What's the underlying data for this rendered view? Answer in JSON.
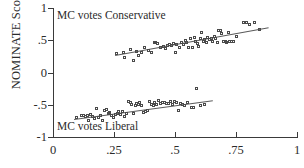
{
  "chart_data": {
    "type": "scatter",
    "title": "",
    "xlabel": "",
    "ylabel": "NOMINATE Score",
    "xlim": [
      0,
      1
    ],
    "ylim": [
      -1,
      1
    ],
    "grid": false,
    "legend": null,
    "xticks": [
      "0",
      ".25",
      ".5",
      ".75",
      "1"
    ],
    "xtick_values": [
      0,
      0.25,
      0.5,
      0.75,
      1
    ],
    "yticks": [
      "1",
      ".5",
      "0",
      "-.5",
      "-1"
    ],
    "ytick_values": [
      1,
      0.5,
      0,
      -0.5,
      -1
    ],
    "annotations": [
      {
        "text": "MC votes Conservative",
        "x": 0.02,
        "y": 0.93
      },
      {
        "text": "MC votes Liberal",
        "x": 0.02,
        "y": -0.8
      }
    ],
    "series": [
      {
        "name": "MC votes Conservative",
        "marker": "open-square",
        "fit_line": {
          "x0": 0.255,
          "y0": 0.275,
          "x1": 0.885,
          "y1": 0.705
        },
        "points": [
          [
            0.262,
            0.285
          ],
          [
            0.289,
            0.3
          ],
          [
            0.295,
            0.228
          ],
          [
            0.318,
            0.352
          ],
          [
            0.33,
            0.183
          ],
          [
            0.345,
            0.318
          ],
          [
            0.352,
            0.262
          ],
          [
            0.366,
            0.3
          ],
          [
            0.378,
            0.378
          ],
          [
            0.392,
            0.33
          ],
          [
            0.405,
            0.3
          ],
          [
            0.418,
            0.455
          ],
          [
            0.424,
            0.452
          ],
          [
            0.432,
            0.448
          ],
          [
            0.441,
            0.385
          ],
          [
            0.455,
            0.402
          ],
          [
            0.462,
            0.372
          ],
          [
            0.47,
            0.418
          ],
          [
            0.478,
            0.43
          ],
          [
            0.488,
            0.408
          ],
          [
            0.497,
            0.438
          ],
          [
            0.503,
            0.3
          ],
          [
            0.51,
            0.428
          ],
          [
            0.52,
            0.375
          ],
          [
            0.528,
            0.462
          ],
          [
            0.535,
            0.432
          ],
          [
            0.544,
            0.492
          ],
          [
            0.551,
            0.455
          ],
          [
            0.558,
            0.378
          ],
          [
            0.566,
            0.512
          ],
          [
            0.572,
            0.382
          ],
          [
            0.58,
            0.532
          ],
          [
            0.588,
            0.468
          ],
          [
            0.595,
            0.448
          ],
          [
            0.6,
            0.392
          ],
          [
            0.607,
            0.512
          ],
          [
            0.612,
            0.618
          ],
          [
            0.618,
            0.475
          ],
          [
            0.624,
            0.502
          ],
          [
            0.63,
            0.455
          ],
          [
            0.637,
            0.54
          ],
          [
            0.643,
            0.498
          ],
          [
            0.65,
            0.522
          ],
          [
            0.656,
            0.478
          ],
          [
            0.662,
            0.555
          ],
          [
            0.668,
            0.512
          ],
          [
            0.675,
            0.455
          ],
          [
            0.681,
            0.64
          ],
          [
            0.688,
            0.642
          ],
          [
            0.694,
            0.602
          ],
          [
            0.7,
            0.47
          ],
          [
            0.707,
            0.478
          ],
          [
            0.714,
            0.462
          ],
          [
            0.72,
            0.612
          ],
          [
            0.727,
            0.468
          ],
          [
            0.735,
            0.472
          ],
          [
            0.742,
            0.468
          ],
          [
            0.755,
            0.558
          ],
          [
            0.782,
            0.775
          ],
          [
            0.795,
            0.76
          ],
          [
            0.808,
            0.742
          ],
          [
            0.828,
            0.768
          ],
          [
            0.848,
            0.66
          ]
        ]
      },
      {
        "name": "MC votes Liberal",
        "marker": "open-square",
        "fit_line": {
          "x0": 0.085,
          "y0": -0.718,
          "x1": 0.655,
          "y1": -0.425
        },
        "points": [
          [
            0.098,
            -0.7
          ],
          [
            0.118,
            -0.68
          ],
          [
            0.128,
            -0.67
          ],
          [
            0.134,
            -0.688
          ],
          [
            0.142,
            -0.675
          ],
          [
            0.148,
            -0.745
          ],
          [
            0.155,
            -0.655
          ],
          [
            0.162,
            -0.69
          ],
          [
            0.172,
            -0.72
          ],
          [
            0.18,
            -0.572
          ],
          [
            0.188,
            -0.7
          ],
          [
            0.196,
            -0.668
          ],
          [
            0.204,
            -0.748
          ],
          [
            0.212,
            -0.602
          ],
          [
            0.22,
            -0.588
          ],
          [
            0.228,
            -0.65
          ],
          [
            0.235,
            -0.625
          ],
          [
            0.242,
            -0.672
          ],
          [
            0.25,
            -0.712
          ],
          [
            0.258,
            -0.658
          ],
          [
            0.265,
            -0.638
          ],
          [
            0.272,
            -0.62
          ],
          [
            0.28,
            -0.662
          ],
          [
            0.288,
            -0.608
          ],
          [
            0.296,
            -0.695
          ],
          [
            0.302,
            -0.64
          ],
          [
            0.31,
            -0.462
          ],
          [
            0.318,
            -0.478
          ],
          [
            0.325,
            -0.5
          ],
          [
            0.332,
            -0.638
          ],
          [
            0.34,
            -0.512
          ],
          [
            0.346,
            -0.492
          ],
          [
            0.352,
            -0.505
          ],
          [
            0.358,
            -0.47
          ],
          [
            0.366,
            -0.518
          ],
          [
            0.372,
            -0.622
          ],
          [
            0.38,
            -0.608
          ],
          [
            0.388,
            -0.592
          ],
          [
            0.396,
            -0.46
          ],
          [
            0.404,
            -0.498
          ],
          [
            0.412,
            -0.512
          ],
          [
            0.42,
            -0.47
          ],
          [
            0.428,
            -0.508
          ],
          [
            0.436,
            -0.448
          ],
          [
            0.444,
            -0.485
          ],
          [
            0.452,
            -0.468
          ],
          [
            0.46,
            -0.478
          ],
          [
            0.468,
            -0.495
          ],
          [
            0.476,
            -0.488
          ],
          [
            0.484,
            -0.462
          ],
          [
            0.492,
            -0.505
          ],
          [
            0.5,
            -0.452
          ],
          [
            0.508,
            -0.478
          ],
          [
            0.516,
            -0.59
          ],
          [
            0.524,
            -0.482
          ],
          [
            0.532,
            -0.498
          ],
          [
            0.54,
            -0.512
          ],
          [
            0.552,
            -0.47
          ],
          [
            0.568,
            -0.548
          ],
          [
            0.578,
            -0.552
          ],
          [
            0.592,
            -0.262
          ],
          [
            0.608,
            -0.52
          ],
          [
            0.622,
            -0.498
          ]
        ]
      }
    ]
  }
}
